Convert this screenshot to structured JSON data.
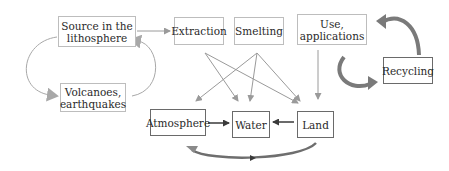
{
  "diagram": {
    "nodes": {
      "source": {
        "label": "Source in the lithosphere",
        "line1": "Source in the",
        "line2": "lithosphere"
      },
      "volcanoes": {
        "label": "Volcanoes, earthquakes",
        "line1": "Volcanoes,",
        "line2": "earthquakes"
      },
      "extraction": {
        "label": "Extraction"
      },
      "smelting": {
        "label": "Smelting"
      },
      "use": {
        "label": "Use, applications",
        "line1": "Use,",
        "line2": "applications"
      },
      "recycling": {
        "label": "Recycling"
      },
      "atmosphere": {
        "label": "Atmosphere"
      },
      "water": {
        "label": "Water"
      },
      "land": {
        "label": "Land"
      }
    },
    "edges": [
      {
        "from": "source",
        "to": "extraction"
      },
      {
        "from": "source",
        "to": "volcanoes",
        "style": "curved"
      },
      {
        "from": "volcanoes",
        "to": "source",
        "style": "curved"
      },
      {
        "from": "extraction",
        "to": "water"
      },
      {
        "from": "extraction",
        "to": "land"
      },
      {
        "from": "smelting",
        "to": "atmosphere"
      },
      {
        "from": "smelting",
        "to": "water"
      },
      {
        "from": "smelting",
        "to": "land"
      },
      {
        "from": "use",
        "to": "land"
      },
      {
        "from": "use",
        "to": "recycling",
        "style": "thick-curved"
      },
      {
        "from": "recycling",
        "to": "use",
        "style": "thick-curved"
      },
      {
        "from": "atmosphere",
        "to": "water"
      },
      {
        "from": "land",
        "to": "water"
      },
      {
        "from": "land",
        "to": "atmosphere",
        "style": "thick-curved"
      }
    ],
    "colors": {
      "line": "#9a9a9a",
      "dark_line": "#4a4a4a",
      "thick_arrow": "#7a7a7a",
      "box_border": "#bdbdbd"
    }
  }
}
